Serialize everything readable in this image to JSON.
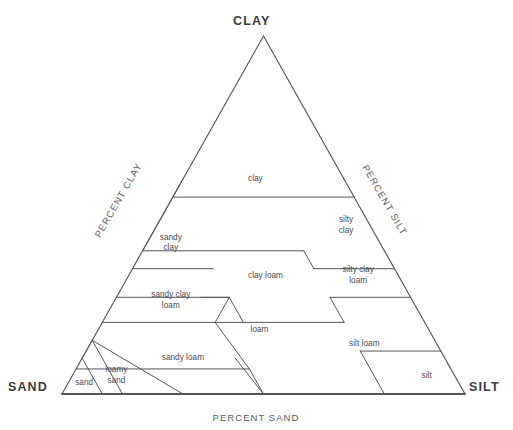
{
  "chart_data": {
    "type": "diagram",
    "corners": [
      {
        "name": "clay-apex",
        "label": "CLAY"
      },
      {
        "name": "sand-corner",
        "label": "SAND"
      },
      {
        "name": "silt-corner",
        "label": "SILT"
      }
    ],
    "axes": [
      {
        "name": "left-axis",
        "label": "PERCENT CLAY",
        "rotation": -60
      },
      {
        "name": "right-axis",
        "label": "PERCENT SILT",
        "rotation": 60
      },
      {
        "name": "bottom-axis",
        "label": "PERCENT SAND",
        "rotation": 0
      }
    ],
    "regions": [
      {
        "id": "clay",
        "label": "clay",
        "centroid": {
          "clay": 60,
          "sand": 22
        }
      },
      {
        "id": "silty-clay",
        "label": "silty\nclay",
        "centroid": {
          "clay": 47,
          "sand": 6
        }
      },
      {
        "id": "sandy-clay",
        "label": "sandy\nclay",
        "centroid": {
          "clay": 42,
          "sand": 52
        }
      },
      {
        "id": "clay-loam",
        "label": "clay loam",
        "centroid": {
          "clay": 33,
          "sand": 33
        }
      },
      {
        "id": "silty-clay-loam",
        "label": "silty clay\nloam",
        "centroid": {
          "clay": 33,
          "sand": 10
        }
      },
      {
        "id": "sandy-clay-loam",
        "label": "sandy clay\nloam",
        "centroid": {
          "clay": 26,
          "sand": 60
        }
      },
      {
        "id": "loam",
        "label": "loam",
        "centroid": {
          "clay": 18,
          "sand": 42
        }
      },
      {
        "id": "silt-loam",
        "label": "silt loam",
        "centroid": {
          "clay": 14,
          "sand": 18
        }
      },
      {
        "id": "sandy-loam",
        "label": "sandy loam",
        "centroid": {
          "clay": 10,
          "sand": 65
        }
      },
      {
        "id": "loamy-sand",
        "label": "loamy\nsand",
        "centroid": {
          "clay": 5,
          "sand": 84
        }
      },
      {
        "id": "sand",
        "label": "sand",
        "centroid": {
          "clay": 3,
          "sand": 93
        }
      },
      {
        "id": "silt",
        "label": "silt",
        "centroid": {
          "clay": 5,
          "sand": 7
        }
      }
    ],
    "boundaries": [
      [
        [
          55,
          45
        ],
        [
          55,
          0
        ]
      ],
      [
        [
          40,
          60
        ],
        [
          40,
          20
        ]
      ],
      [
        [
          40,
          20
        ],
        [
          35,
          20
        ]
      ],
      [
        [
          35,
          20
        ],
        [
          35,
          0
        ]
      ],
      [
        [
          60,
          40
        ],
        [
          40,
          60
        ]
      ],
      [
        [
          27,
          73
        ],
        [
          27,
          45
        ]
      ],
      [
        [
          27,
          45
        ],
        [
          20,
          52
        ]
      ],
      [
        [
          20,
          52
        ],
        [
          20,
          20
        ]
      ],
      [
        [
          20,
          20
        ],
        [
          27,
          20
        ]
      ],
      [
        [
          27,
          20
        ],
        [
          27,
          0
        ]
      ],
      [
        [
          35,
          65
        ],
        [
          35,
          45
        ]
      ],
      [
        [
          20,
          80
        ],
        [
          20,
          52
        ]
      ],
      [
        [
          7,
          93
        ],
        [
          7,
          50
        ]
      ],
      [
        [
          7,
          50
        ],
        [
          0,
          50
        ]
      ],
      [
        [
          20,
          45
        ],
        [
          27,
          45
        ]
      ],
      [
        [
          27,
          45
        ],
        [
          27,
          52
        ]
      ],
      [
        [
          7,
          50
        ],
        [
          20,
          52
        ]
      ],
      [
        [
          0,
          85
        ],
        [
          15,
          85
        ]
      ],
      [
        [
          15,
          85
        ],
        [
          10,
          90
        ]
      ],
      [
        [
          10,
          90
        ],
        [
          0,
          90
        ]
      ],
      [
        [
          0,
          70
        ],
        [
          15,
          85
        ]
      ],
      [
        [
          12,
          0
        ],
        [
          12,
          20
        ]
      ],
      [
        [
          12,
          20
        ],
        [
          0,
          20
        ]
      ],
      [
        [
          10,
          52
        ],
        [
          0,
          50
        ]
      ]
    ]
  }
}
